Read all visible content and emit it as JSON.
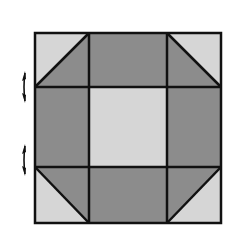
{
  "diagram": {
    "type": "quilt-block",
    "pattern": "shoo-fly / churn-dash style nine-patch",
    "grid": {
      "rows": 3,
      "cols": 3
    },
    "colors": {
      "background": "#ffffff",
      "light": "#d6d6d6",
      "dark": "#8c8c8c",
      "line": "#111111"
    },
    "bounds": {
      "x0": 35,
      "y0": 33,
      "x1": 221,
      "y1": 223
    },
    "cuts": {
      "x": [
        35,
        89,
        167,
        221
      ],
      "y": [
        33,
        87,
        167,
        223
      ]
    },
    "cells": [
      {
        "row": 0,
        "col": 0,
        "kind": "half-square-triangle",
        "diagonal": "bottom-left-to-top-right",
        "light_side": "top-left",
        "dark_side": "bottom-right"
      },
      {
        "row": 0,
        "col": 1,
        "kind": "solid",
        "fill": "dark"
      },
      {
        "row": 0,
        "col": 2,
        "kind": "half-square-triangle",
        "diagonal": "top-left-to-bottom-right",
        "light_side": "top-right",
        "dark_side": "bottom-left"
      },
      {
        "row": 1,
        "col": 0,
        "kind": "solid",
        "fill": "dark"
      },
      {
        "row": 1,
        "col": 1,
        "kind": "solid",
        "fill": "light"
      },
      {
        "row": 1,
        "col": 2,
        "kind": "solid",
        "fill": "dark"
      },
      {
        "row": 2,
        "col": 0,
        "kind": "half-square-triangle",
        "diagonal": "top-left-to-bottom-right",
        "light_side": "bottom-left",
        "dark_side": "top-right"
      },
      {
        "row": 2,
        "col": 1,
        "kind": "solid",
        "fill": "dark"
      },
      {
        "row": 2,
        "col": 2,
        "kind": "half-square-triangle",
        "diagonal": "bottom-left-to-top-right",
        "light_side": "bottom-right",
        "dark_side": "top-left"
      }
    ],
    "markers": [
      {
        "name": "seam-arrow-upper",
        "x": 24,
        "y": 87,
        "glyph": "double-headed vertical arrow"
      },
      {
        "name": "seam-arrow-lower",
        "x": 24,
        "y": 160,
        "glyph": "double-headed vertical arrow"
      }
    ]
  }
}
